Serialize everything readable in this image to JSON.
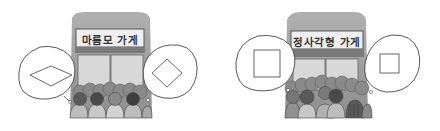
{
  "panels": [
    {
      "store_sign": "마름모 가게",
      "left_bubble_shape": "rhombus",
      "right_bubble_shape": "rhombus"
    },
    {
      "store_sign": "정사각형 가게",
      "left_bubble_shape": "square",
      "right_bubble_shape": "square"
    }
  ],
  "colors": {
    "roof": "#9a9a9a",
    "sign_bg": "#efefef",
    "sign_border": "#555555",
    "door": "#d8d8d8",
    "crowd_dark": "#5a5a5a",
    "crowd_mid": "#8a8a8a",
    "bubble_stroke": "#444444"
  }
}
